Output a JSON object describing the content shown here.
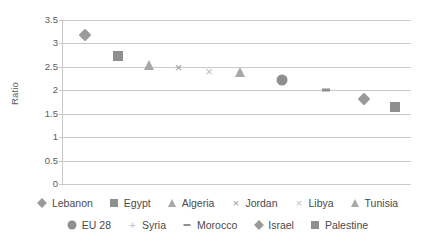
{
  "chart_data": {
    "type": "scatter",
    "title": "",
    "subtitle": "",
    "xlabel": "",
    "ylabel": "Ratio",
    "ylim": [
      0,
      3.5
    ],
    "ytick_labels": [
      "3.5",
      "3",
      "2.5",
      "2",
      "1.5",
      "1",
      "0.5",
      "0"
    ],
    "ytick_values": [
      3.5,
      3,
      2.5,
      2,
      1.5,
      1,
      0.5,
      0
    ],
    "grid": true,
    "x_axis_visible": false,
    "legend_position": "bottom",
    "categories": [
      "Lebanon",
      "Egypt",
      "Algeria",
      "Jordan",
      "Libya",
      "Tunisia",
      "EU 28",
      "Syria",
      "Morocco",
      "Israel",
      "Palestine"
    ],
    "values": [
      3.18,
      2.73,
      2.55,
      2.49,
      2.41,
      2.38,
      2.22,
      null,
      2.0,
      1.82,
      1.65
    ],
    "series": [
      {
        "name": "Lebanon",
        "marker": "diamond",
        "x_pos": 6.3,
        "value": 3.18,
        "color": "#9a9a9a"
      },
      {
        "name": "Egypt",
        "marker": "square",
        "x_pos": 15.8,
        "value": 2.73,
        "color": "#8f8f8f"
      },
      {
        "name": "Algeria",
        "marker": "triangle",
        "x_pos": 24.7,
        "value": 2.55,
        "color": "#a8a8a8"
      },
      {
        "name": "Jordan",
        "marker": "x",
        "x_pos": 33.2,
        "value": 2.49,
        "color": "#9a9a9a"
      },
      {
        "name": "Libya",
        "marker": "x-light",
        "x_pos": 42.0,
        "value": 2.41,
        "color": "#bdbdbd"
      },
      {
        "name": "Tunisia",
        "marker": "triangle",
        "x_pos": 51.0,
        "value": 2.38,
        "color": "#a8a8a8"
      },
      {
        "name": "EU 28",
        "marker": "circle",
        "x_pos": 63.0,
        "value": 2.22,
        "color": "#8f8f8f"
      },
      {
        "name": "Syria",
        "marker": "plus",
        "x_pos": null,
        "value": null,
        "color": "#c2c2c2"
      },
      {
        "name": "Morocco",
        "marker": "dash",
        "x_pos": 75.5,
        "value": 2.0,
        "color": "#8f8f8f"
      },
      {
        "name": "Israel",
        "marker": "diamond",
        "x_pos": 86.5,
        "value": 1.82,
        "color": "#9a9a9a"
      },
      {
        "name": "Palestine",
        "marker": "square",
        "x_pos": 95.5,
        "value": 1.65,
        "color": "#8f8f8f"
      }
    ]
  },
  "legend": {
    "row1": [
      {
        "label": "Lebanon",
        "marker": "diamond"
      },
      {
        "label": "Egypt",
        "marker": "square"
      },
      {
        "label": "Algeria",
        "marker": "triangle"
      },
      {
        "label": "Jordan",
        "marker": "x"
      },
      {
        "label": "Libya",
        "marker": "x-light"
      },
      {
        "label": "Tunisia",
        "marker": "triangle"
      }
    ],
    "row2": [
      {
        "label": "EU 28",
        "marker": "circle"
      },
      {
        "label": "Syria",
        "marker": "plus"
      },
      {
        "label": "Morocco",
        "marker": "dash"
      },
      {
        "label": "Israel",
        "marker": "diamond"
      },
      {
        "label": "Palestine",
        "marker": "square"
      }
    ]
  },
  "colors": {
    "gridline": "#c9c9c9",
    "text": "#4a4a4a",
    "marker_mid": "#9a9a9a",
    "marker_light": "#bdbdbd",
    "background": "#ffffff"
  }
}
